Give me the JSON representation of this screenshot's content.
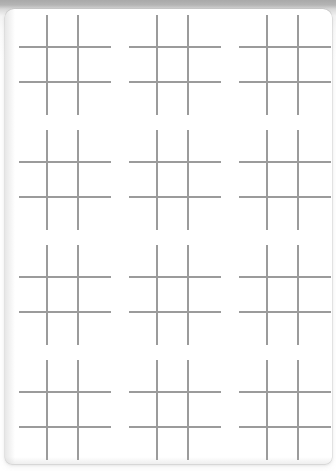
{
  "document": {
    "kind": "printable-worksheet",
    "title": "Tic-Tac-Toe Grid Worksheet",
    "page": {
      "background_color": "#ffffff",
      "surround_color": "#b4b4b4",
      "corner_radius_px": 9,
      "width_px": 327,
      "height_px": 455
    }
  },
  "content": {
    "figure_name": "tic-tac-toe-board",
    "figure_glyph": "#",
    "line_color": "#9b9b9b",
    "line_thickness_px": 2,
    "columns": 3,
    "rows": 4,
    "total_boards": 12,
    "board_width_px": 92,
    "board_height_px": 100,
    "column_pitch_px": 110,
    "row_pitch_px": 115,
    "first_board_left_px": 14,
    "first_board_top_px": 6,
    "lines_per_board": 4,
    "cells_per_board": 9,
    "marks": [],
    "boards": [
      {
        "id": "board-r1-c1",
        "row": 1,
        "column": 1,
        "label": ""
      },
      {
        "id": "board-r1-c2",
        "row": 1,
        "column": 2,
        "label": ""
      },
      {
        "id": "board-r1-c3",
        "row": 1,
        "column": 3,
        "label": ""
      },
      {
        "id": "board-r2-c1",
        "row": 2,
        "column": 1,
        "label": ""
      },
      {
        "id": "board-r2-c2",
        "row": 2,
        "column": 2,
        "label": ""
      },
      {
        "id": "board-r2-c3",
        "row": 2,
        "column": 3,
        "label": ""
      },
      {
        "id": "board-r3-c1",
        "row": 3,
        "column": 1,
        "label": ""
      },
      {
        "id": "board-r3-c2",
        "row": 3,
        "column": 2,
        "label": ""
      },
      {
        "id": "board-r3-c3",
        "row": 3,
        "column": 3,
        "label": ""
      },
      {
        "id": "board-r4-c1",
        "row": 4,
        "column": 1,
        "label": ""
      },
      {
        "id": "board-r4-c2",
        "row": 4,
        "column": 2,
        "label": ""
      },
      {
        "id": "board-r4-c3",
        "row": 4,
        "column": 3,
        "label": ""
      }
    ]
  }
}
